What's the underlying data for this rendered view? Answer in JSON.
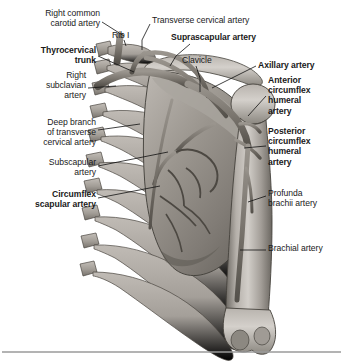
{
  "figure": {
    "style": "grayscale anatomical illustration",
    "colors": {
      "background": "#ffffff",
      "bone_light": "#cfcbc6",
      "bone_mid": "#a8a39d",
      "bone_dark": "#7d7872",
      "bone_shadow": "#5c5852",
      "vessel": "#8d8881",
      "vessel_dark": "#5a5650",
      "outline": "#3c3a37",
      "leader_line": "#111111",
      "text": "#1a1a1a",
      "divider": "#9a9a9a"
    },
    "structures": [
      "rib cage",
      "scapula",
      "clavicle",
      "humerus",
      "subclavian and axillary vessels"
    ]
  },
  "labels": [
    {
      "id": "right-common-carotid-artery",
      "text": "Right common\ncarotid artery",
      "bold": false,
      "align": "right",
      "x": 4,
      "y": 8,
      "width": 96
    },
    {
      "id": "rib-i",
      "text": "Rib I",
      "bold": false,
      "align": "left",
      "x": 112,
      "y": 30,
      "width": 34
    },
    {
      "id": "transverse-cervical-artery",
      "text": "Transverse cervical artery",
      "bold": false,
      "align": "left",
      "x": 152,
      "y": 15,
      "width": 140
    },
    {
      "id": "suprascapular-artery",
      "text": "Suprascapular artery",
      "bold": true,
      "align": "left",
      "x": 171,
      "y": 32,
      "width": 130
    },
    {
      "id": "thyrocervical-trunk",
      "text": "Thyrocervical\ntrunk",
      "bold": true,
      "align": "right",
      "x": 4,
      "y": 45,
      "width": 92
    },
    {
      "id": "clavicle",
      "text": "Clavicle",
      "bold": false,
      "align": "left",
      "x": 182,
      "y": 55,
      "width": 48
    },
    {
      "id": "right-subclavian-artery",
      "text": "Right\nsubclavian\nartery",
      "bold": false,
      "align": "right",
      "x": 4,
      "y": 70,
      "width": 82
    },
    {
      "id": "axillary-artery",
      "text": "Axillary artery",
      "bold": true,
      "align": "left",
      "x": 258,
      "y": 60,
      "width": 84
    },
    {
      "id": "anterior-circumflex-humeral-artery",
      "text": "Anterior\ncircumflex\nhumeral\nartery",
      "bold": true,
      "align": "left",
      "x": 268,
      "y": 75,
      "width": 72
    },
    {
      "id": "deep-branch-of-transverse-cervical-artery",
      "text": "Deep branch\nof transverse\ncervical artery",
      "bold": false,
      "align": "right",
      "x": 4,
      "y": 117,
      "width": 92
    },
    {
      "id": "posterior-circumflex-humeral-artery",
      "text": "Posterior\ncircumflex\nhumeral\nartery",
      "bold": true,
      "align": "left",
      "x": 268,
      "y": 126,
      "width": 72
    },
    {
      "id": "subscapular-artery",
      "text": "Subscapular\nartery",
      "bold": false,
      "align": "right",
      "x": 4,
      "y": 157,
      "width": 92
    },
    {
      "id": "profunda-brachii-artery",
      "text": "Profunda\nbrachii artery",
      "bold": false,
      "align": "left",
      "x": 268,
      "y": 188,
      "width": 74
    },
    {
      "id": "circumflex-scapular-artery",
      "text": "Circumflex\nscapular artery",
      "bold": true,
      "align": "right",
      "x": 4,
      "y": 189,
      "width": 92
    },
    {
      "id": "brachial-artery",
      "text": "Brachial artery",
      "bold": false,
      "align": "left",
      "x": 268,
      "y": 243,
      "width": 80
    }
  ]
}
